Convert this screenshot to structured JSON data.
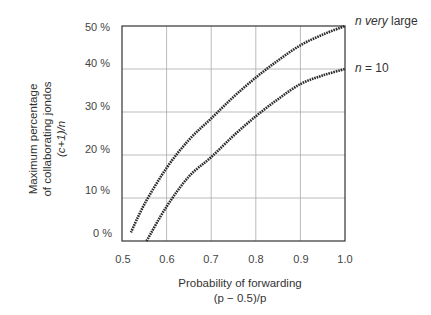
{
  "chart_data": {
    "type": "line",
    "title": "",
    "xlabel": "Probability of forwarding (p − 0.5)/p",
    "ylabel": "Maximum percentage of collaborating jondos (c+1)/n",
    "xlim": [
      0.5,
      1.0
    ],
    "ylim": [
      0,
      50
    ],
    "grid": true,
    "x_ticks": [
      "0.5",
      "0.6",
      "0.7",
      "0.8",
      "0.9",
      "1.0"
    ],
    "y_ticks": [
      "0 %",
      "10 %",
      "20 %",
      "30 %",
      "40 %",
      "50 %"
    ],
    "legend_position": "right (inline labels at line ends)",
    "series": [
      {
        "name": "n very large",
        "x": [
          0.52,
          0.55,
          0.6,
          0.65,
          0.7,
          0.75,
          0.8,
          0.85,
          0.9,
          0.95,
          1.0
        ],
        "y": [
          2,
          8.5,
          17,
          23.5,
          28.5,
          33.5,
          38,
          42,
          45.5,
          48,
          50
        ]
      },
      {
        "name": "n = 10",
        "x": [
          0.555,
          0.6,
          0.65,
          0.7,
          0.75,
          0.8,
          0.85,
          0.9,
          0.95,
          1.0
        ],
        "y": [
          0,
          8,
          15,
          19.5,
          24.5,
          29,
          33,
          36.5,
          38.5,
          40
        ]
      }
    ]
  },
  "axes": {
    "y_ticks": [
      "50 %",
      "40 %",
      "30 %",
      "20 %",
      "10 %",
      "0 %"
    ],
    "x_ticks": [
      "0.5",
      "0.6",
      "0.7",
      "0.8",
      "0.9",
      "1.0"
    ],
    "ylabel_lines": [
      "Maximum percentage",
      "of collaborating jondos",
      "(c+1)/n"
    ],
    "xlabel_lines": [
      "Probability of forwarding",
      "(p − 0.5)/p"
    ]
  },
  "legend": {
    "upper": {
      "italic": "n very",
      "rest": " large"
    },
    "lower": {
      "italic": "n",
      "rest": " = 10"
    }
  }
}
